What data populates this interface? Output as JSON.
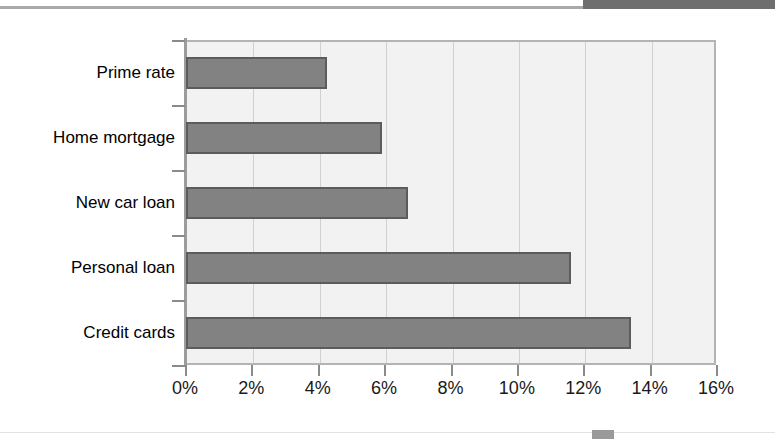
{
  "chart_data": {
    "type": "bar",
    "orientation": "horizontal",
    "title": "",
    "xlabel": "",
    "ylabel": "",
    "categories": [
      "Prime rate",
      "Home mortgage",
      "New car loan",
      "Personal loan",
      "Credit cards"
    ],
    "values": [
      4.25,
      5.9,
      6.7,
      11.6,
      13.4
    ],
    "value_unit": "%",
    "xlim": [
      0,
      16
    ],
    "xticks": [
      0,
      2,
      4,
      6,
      8,
      10,
      12,
      14,
      16
    ],
    "xtick_labels": [
      "0%",
      "2%",
      "4%",
      "6%",
      "8%",
      "10%",
      "12%",
      "14%",
      "16%"
    ],
    "grid": true,
    "grid_axis": "x",
    "legend": "none",
    "series": [
      {
        "name": "Interest rate",
        "values": [
          4.25,
          5.9,
          6.7,
          11.6,
          13.4
        ]
      }
    ],
    "colors": {
      "bar_fill": "#828282",
      "bar_border": "#5c5c5c",
      "plot_background": "#f2f2f2",
      "gridline": "#d0d0d0",
      "axis": "#9c9c9c",
      "text": "#000000"
    }
  },
  "page": {
    "top_rule_color": "#a9a9a9",
    "top_block_color": "#6e6e6e",
    "bottom_mark_color": "#9a9a9a"
  }
}
